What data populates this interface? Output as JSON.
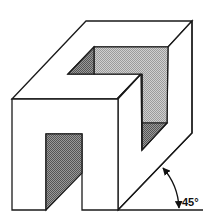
{
  "figure": {
    "type": "oblique projection drawing",
    "angle_label": "45°",
    "colors": {
      "line": "#1a1a1a",
      "background": "#ffffff",
      "shade_dark": "#7a7a7a",
      "shade_light": "#bdbdbd"
    }
  }
}
